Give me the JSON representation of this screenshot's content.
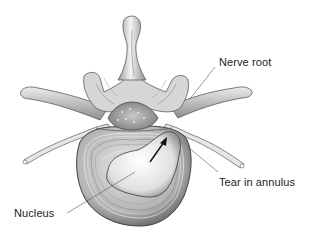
{
  "figure": {
    "background": "#ffffff",
    "labels": {
      "nerve_root": "Nerve root",
      "tear_in_annulus": "Tear in annulus",
      "nucleus": "Nucleus"
    },
    "colors": {
      "line": "#555555",
      "bone_light": "#f2f2f2",
      "bone_mid": "#bdbdbd",
      "bone_dark": "#6e6e6e",
      "text": "#222222"
    }
  }
}
